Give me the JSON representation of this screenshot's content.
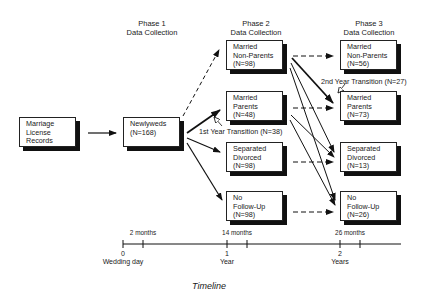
{
  "phases": [
    {
      "title": "Phase 1",
      "subtitle": "Data Collection"
    },
    {
      "title": "Phase 2",
      "subtitle": "Data Collection"
    },
    {
      "title": "Phase 3",
      "subtitle": "Data Collection"
    }
  ],
  "boxes": {
    "source": {
      "lines": [
        "Marriage",
        "License",
        "Records"
      ]
    },
    "phase1": {
      "lines": [
        "Newlyweds",
        "(N=168)"
      ]
    },
    "phase2": [
      {
        "lines": [
          "Married",
          "Non-Parents",
          "(N=98)"
        ]
      },
      {
        "lines": [
          "Married",
          "Parents",
          "(N=48)"
        ]
      },
      {
        "lines": [
          "Separated",
          "Divorced",
          "(N=98)"
        ]
      },
      {
        "lines": [
          "No",
          "Follow-Up",
          "(N=98)"
        ]
      }
    ],
    "phase3": [
      {
        "lines": [
          "Married",
          "Non-Parents",
          "(N=56)"
        ]
      },
      {
        "lines": [
          "Married",
          "Parents",
          "(N=73)"
        ]
      },
      {
        "lines": [
          "Separated",
          "Divorced",
          "(N=13)"
        ]
      },
      {
        "lines": [
          "No",
          "Follow-Up",
          "(N=26)"
        ]
      }
    ]
  },
  "transitions": {
    "first": "1st Year Transition (N=38)",
    "second": "2nd Year Transition (N=27)"
  },
  "timeline": {
    "ticks_above": [
      "2 months",
      "14 months",
      "26 months"
    ],
    "ticks_below": [
      {
        "num": "0",
        "label": "Wedding day"
      },
      {
        "num": "1",
        "label": "Year"
      },
      {
        "num": "2",
        "label": "Years"
      }
    ],
    "caption": "Timeline"
  }
}
